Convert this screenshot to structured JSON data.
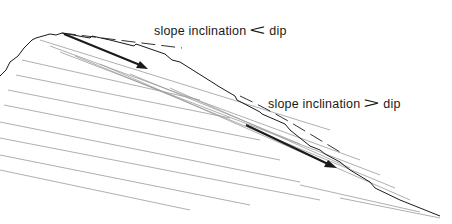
{
  "diagram": {
    "type": "geological cross-section: bedded rock slope",
    "labels": [
      {
        "id": "upper",
        "text": "slope inclination",
        "relation": "<",
        "relation_symbol": "<",
        "tail": "dip"
      },
      {
        "id": "lower",
        "text": "slope inclination",
        "relation": ">",
        "relation_symbol": ">",
        "tail": "dip"
      }
    ],
    "arrows": [
      {
        "id": "upper-arrow",
        "from": [
          64,
          34
        ],
        "to": [
          146,
          68
        ]
      },
      {
        "id": "lower-arrow",
        "from": [
          246,
          125
        ],
        "to": [
          335,
          168
        ]
      }
    ],
    "colors": {
      "ink": "#1a1a1a",
      "hatch": "#9a9a9a",
      "background": "#ffffff"
    }
  }
}
